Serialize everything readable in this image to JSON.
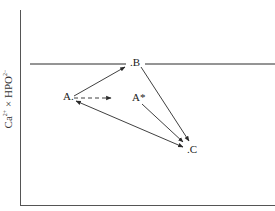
{
  "diagram": {
    "y_axis_label": {
      "base1": "Ca",
      "sup1": "2+",
      "times": " × ",
      "base2": "HPO",
      "sup2": "2−",
      "sub2": "4"
    },
    "points": {
      "A": ".A",
      "A_label": "A.",
      "A_star": "A*",
      "B": ".B",
      "C": ".C"
    },
    "solubility_line": "horizontal reference line through B",
    "colors": {
      "line": "#2a2a2a",
      "background": "#ffffff"
    }
  }
}
